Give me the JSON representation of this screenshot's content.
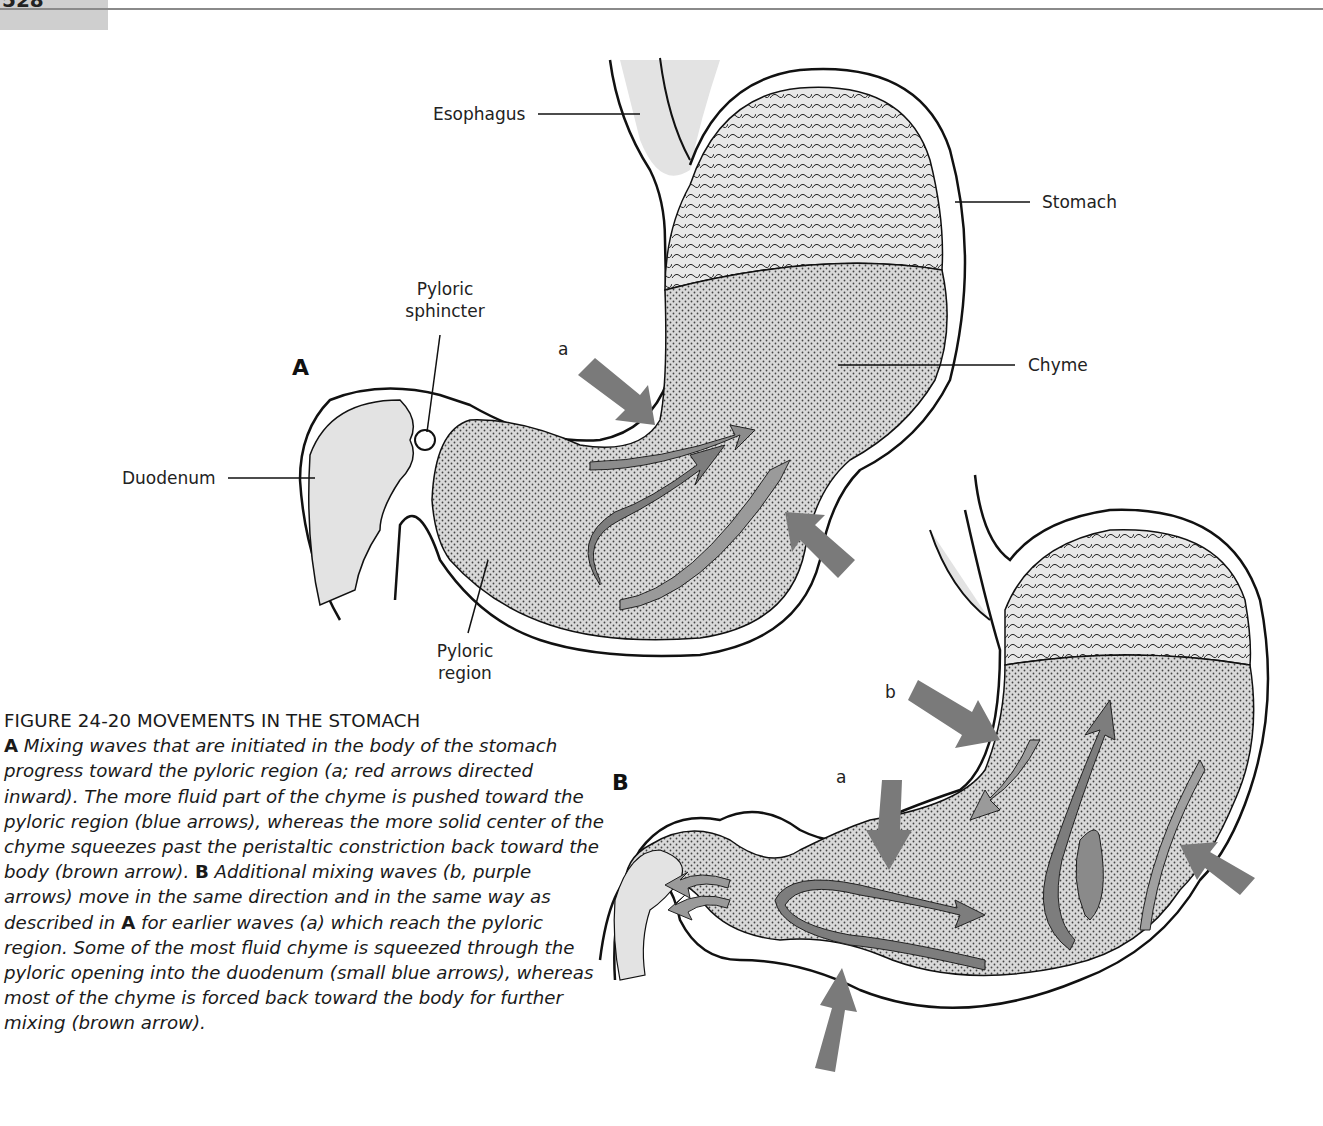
{
  "page": {
    "number": "528"
  },
  "figure": {
    "panels": {
      "A": {
        "label": "A",
        "labels": {
          "esophagus": "Esophagus",
          "stomach": "Stomach",
          "pyloric_sphincter_line1": "Pyloric",
          "pyloric_sphincter_line2": "sphincter",
          "chyme": "Chyme",
          "duodenum": "Duodenum",
          "pyloric_region_line1": "Pyloric",
          "pyloric_region_line2": "region",
          "wave_a": "a"
        }
      },
      "B": {
        "label": "B",
        "labels": {
          "wave_a": "a",
          "wave_b": "b"
        }
      }
    },
    "colors": {
      "arrow_fill": "#7a7a7a",
      "chyme_fill": "#d6d6d6",
      "mucosa_fill": "#e6e6e6",
      "outline": "#111111"
    }
  },
  "caption": {
    "title": "FIGURE 24-20 MOVEMENTS IN THE STOMACH",
    "panel_a_marker": "A",
    "text_1": " Mixing waves that are initiated in the body of the stomach progress toward the pyloric region (a; red arrows directed inward). The more fluid part of the chyme is pushed toward the pyloric region (blue arrows), whereas the more solid center of the chyme squeezes past the peristaltic constriction back toward the body (brown arrow). ",
    "panel_b_marker": "B",
    "text_2": " Additional mixing waves (b, purple arrows) move in the same direction and in the same way as described in ",
    "panel_a_ref": "A",
    "text_3": " for earlier waves (a) which reach the pyloric region. Some of the most fluid chyme is squeezed through the pyloric opening into the duodenum (small blue arrows), whereas most of the chyme is forced back toward the body for further mixing (brown arrow)."
  }
}
